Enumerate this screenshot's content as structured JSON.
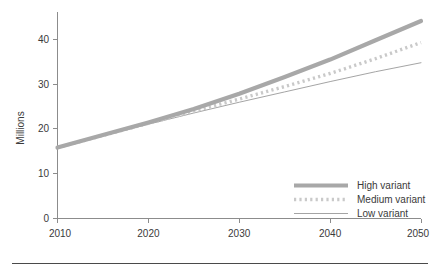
{
  "chart_data": {
    "type": "line",
    "title": "",
    "subtitle": "",
    "xlabel": "",
    "ylabel": "Millions",
    "xlim": [
      2010,
      2050
    ],
    "ylim": [
      0,
      46
    ],
    "grid": false,
    "legend_position": "bottom-right",
    "x_ticks": [
      "2010",
      "2020",
      "2030",
      "2040",
      "2050"
    ],
    "x_tick_values": [
      2010,
      2020,
      2030,
      2040,
      2050
    ],
    "y_ticks": [
      "0",
      "10",
      "20",
      "30",
      "40"
    ],
    "y_tick_values": [
      0,
      10,
      20,
      30,
      40
    ],
    "x": [
      2010,
      2015,
      2020,
      2025,
      2030,
      2035,
      2040,
      2045,
      2050
    ],
    "series": [
      {
        "name": "High variant",
        "style": "thick-solid",
        "color": "#a8a8a8",
        "values": [
          15.8,
          18.6,
          21.4,
          24.4,
          27.8,
          31.5,
          35.4,
          39.7,
          44.0
        ]
      },
      {
        "name": "Medium variant",
        "style": "dotted",
        "color": "#c9c9c9",
        "values": [
          15.8,
          18.5,
          21.2,
          23.9,
          26.6,
          29.4,
          32.3,
          35.6,
          39.2
        ]
      },
      {
        "name": "Low variant",
        "style": "thin-solid",
        "color": "#9a9a9a",
        "values": [
          15.8,
          18.4,
          21.0,
          23.5,
          25.9,
          28.2,
          30.5,
          32.7,
          34.7
        ]
      }
    ]
  },
  "legend": {
    "items": [
      {
        "label": "High variant"
      },
      {
        "label": "Medium variant"
      },
      {
        "label": "Low variant"
      }
    ]
  },
  "axes": {
    "y_title": "Millions"
  },
  "colors": {
    "axis": "#8c8c8c",
    "text": "#3a3a3a",
    "high": "#a8a8a8",
    "medium": "#c9c9c9",
    "low": "#9a9a9a",
    "rule": "#4a4a4a"
  }
}
